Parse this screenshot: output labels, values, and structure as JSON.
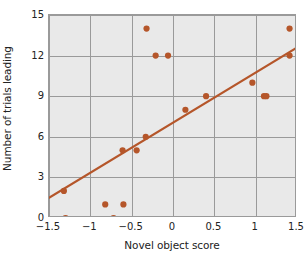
{
  "chart_data": {
    "type": "scatter",
    "title": "",
    "xlabel": "Novel object score",
    "ylabel": "Number of trials leading",
    "xlim": [
      -1.5,
      1.5
    ],
    "ylim": [
      0,
      15
    ],
    "xticks": [
      "−1.5",
      "−1",
      "−0.5",
      "0",
      "0.5",
      "1",
      "1.5"
    ],
    "xtick_values": [
      -1.5,
      -1,
      -0.5,
      0,
      0.5,
      1,
      1.5
    ],
    "yticks": [
      "0",
      "3",
      "6",
      "9",
      "12",
      "15"
    ],
    "ytick_values": [
      0,
      3,
      6,
      9,
      12,
      15
    ],
    "grid": true,
    "legend": "none",
    "series": [
      {
        "name": "observations",
        "type": "scatter",
        "marker": "circle",
        "color": "#b5562a",
        "points": [
          {
            "x": -1.3,
            "y": 0
          },
          {
            "x": -1.32,
            "y": 2
          },
          {
            "x": -0.82,
            "y": 1
          },
          {
            "x": -0.72,
            "y": 0
          },
          {
            "x": -0.6,
            "y": 1
          },
          {
            "x": -0.61,
            "y": 5
          },
          {
            "x": -0.44,
            "y": 5
          },
          {
            "x": -0.33,
            "y": 6
          },
          {
            "x": -0.32,
            "y": 14
          },
          {
            "x": -0.21,
            "y": 12
          },
          {
            "x": -0.06,
            "y": 12
          },
          {
            "x": 0.15,
            "y": 8
          },
          {
            "x": 0.4,
            "y": 9
          },
          {
            "x": 0.96,
            "y": 10
          },
          {
            "x": 1.1,
            "y": 9
          },
          {
            "x": 1.13,
            "y": 9
          },
          {
            "x": 1.41,
            "y": 14
          },
          {
            "x": 1.41,
            "y": 12
          }
        ]
      },
      {
        "name": "fitted-regression-line",
        "type": "line",
        "color": "#b5562a",
        "endpoints": [
          {
            "x": -1.5,
            "y": 1.5
          },
          {
            "x": 1.5,
            "y": 12.6
          }
        ]
      }
    ],
    "style": {
      "panel_background": "#e9e9e9",
      "gridline_color": "#9a9a9a",
      "marker_color": "#b5562a",
      "line_color": "#b5562a",
      "text_color": "#222222",
      "figure_background": "#ffffff"
    }
  }
}
